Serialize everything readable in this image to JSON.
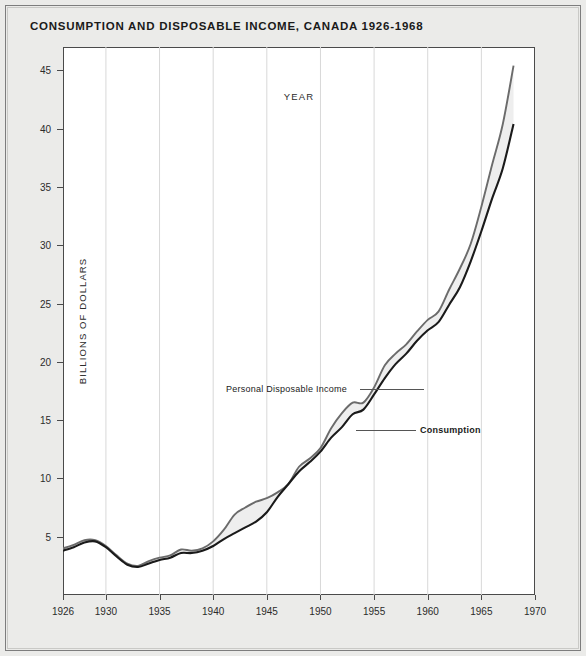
{
  "figure": {
    "title": "CONSUMPTION AND DISPOSABLE INCOME, CANADA 1926-1968"
  },
  "axes": {
    "ylabel": "BILLIONS OF DOLLARS",
    "xlabel": "YEAR",
    "ytick_labels": [
      "5",
      "10",
      "15",
      "20",
      "25",
      "30",
      "35",
      "40",
      "45"
    ],
    "xtick_labels": [
      "1926",
      "1930",
      "1935",
      "1940",
      "1945",
      "1950",
      "1955",
      "1960",
      "1965",
      "1970"
    ]
  },
  "annotations": {
    "income_label": "Personal Disposable Income",
    "consumption_label": "Consumption"
  },
  "colors": {
    "band_fill": "#eeeeee",
    "income_line": "#6b6b6b",
    "consumption_line": "#1a1a1a",
    "gridline": "#d8d8d8",
    "frame": "#4a4a4a",
    "page_background": "#ebebe9",
    "plot_background": "#ffffff"
  },
  "chart_data": {
    "type": "line",
    "title": "CONSUMPTION AND DISPOSABLE INCOME, CANADA 1926-1968",
    "xlabel": "YEAR",
    "ylabel": "BILLIONS OF DOLLARS",
    "xlim": [
      1926,
      1970
    ],
    "ylim": [
      0,
      47
    ],
    "yticks": [
      5,
      10,
      15,
      20,
      25,
      30,
      35,
      40,
      45
    ],
    "xticks": [
      1926,
      1930,
      1935,
      1940,
      1945,
      1950,
      1955,
      1960,
      1965,
      1970
    ],
    "grid": "vertical-only",
    "legend": "inline-annotations",
    "fill_between": true,
    "x": [
      1926,
      1927,
      1928,
      1929,
      1930,
      1931,
      1932,
      1933,
      1934,
      1935,
      1936,
      1937,
      1938,
      1939,
      1940,
      1941,
      1942,
      1943,
      1944,
      1945,
      1946,
      1947,
      1948,
      1949,
      1950,
      1951,
      1952,
      1953,
      1954,
      1955,
      1956,
      1957,
      1958,
      1959,
      1960,
      1961,
      1962,
      1963,
      1964,
      1965,
      1966,
      1967,
      1968
    ],
    "series": [
      {
        "name": "Personal Disposable Income",
        "values": [
          4.0,
          4.3,
          4.7,
          4.7,
          4.2,
          3.4,
          2.7,
          2.5,
          2.9,
          3.2,
          3.4,
          3.9,
          3.8,
          4.0,
          4.6,
          5.6,
          6.9,
          7.5,
          8.0,
          8.3,
          8.8,
          9.5,
          11.0,
          11.7,
          12.6,
          14.3,
          15.6,
          16.5,
          16.5,
          17.8,
          19.7,
          20.7,
          21.5,
          22.6,
          23.6,
          24.3,
          26.2,
          28.0,
          30.1,
          33.3,
          36.9,
          40.4,
          45.4
        ]
      },
      {
        "name": "Consumption",
        "values": [
          3.8,
          4.1,
          4.5,
          4.6,
          4.1,
          3.3,
          2.6,
          2.4,
          2.7,
          3.0,
          3.2,
          3.6,
          3.6,
          3.8,
          4.2,
          4.8,
          5.3,
          5.8,
          6.3,
          7.1,
          8.4,
          9.5,
          10.6,
          11.4,
          12.3,
          13.5,
          14.4,
          15.5,
          15.9,
          17.2,
          18.6,
          19.8,
          20.7,
          21.8,
          22.7,
          23.4,
          24.9,
          26.4,
          28.6,
          31.2,
          34.0,
          36.6,
          40.4
        ]
      }
    ]
  }
}
